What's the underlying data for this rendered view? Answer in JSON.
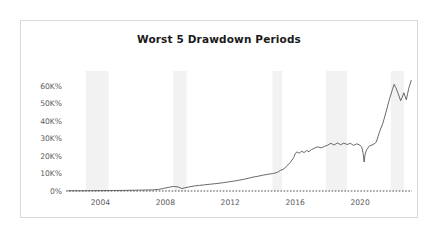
{
  "card": {
    "title": "Worst 5 Drawdown Periods"
  },
  "chart_data": {
    "type": "line",
    "title": "Worst 5 Drawdown Periods",
    "xlabel": "",
    "ylabel": "",
    "grid": false,
    "legend": "none",
    "zero_reference_line": true,
    "xlim": [
      2002.0,
      2023.2
    ],
    "ylim": [
      0,
      65000
    ],
    "yticks": [
      0,
      10000,
      20000,
      30000,
      40000,
      50000,
      60000
    ],
    "ytick_labels": [
      "0%",
      "10K%",
      "20K%",
      "30K%",
      "40K%",
      "50K%",
      "60K%"
    ],
    "xticks": [
      2004,
      2008,
      2012,
      2016,
      2020
    ],
    "xtick_labels": [
      "2004",
      "2008",
      "2012",
      "2016",
      "2020"
    ],
    "series": [
      {
        "name": "Cumulative Return",
        "color": "#4f4f4f",
        "x": [
          2002.0,
          2002.4,
          2002.8,
          2003.2,
          2003.6,
          2004.0,
          2004.4,
          2004.8,
          2005.2,
          2005.6,
          2006.0,
          2006.4,
          2006.8,
          2007.2,
          2007.6,
          2007.9,
          2008.2,
          2008.5,
          2008.8,
          2009.0,
          2009.2,
          2009.5,
          2009.8,
          2010.1,
          2010.4,
          2010.7,
          2011.0,
          2011.3,
          2011.6,
          2011.9,
          2012.2,
          2012.5,
          2012.8,
          2013.1,
          2013.4,
          2013.7,
          2014.0,
          2014.3,
          2014.6,
          2014.9,
          2015.1,
          2015.3,
          2015.5,
          2015.7,
          2015.9,
          2016.0,
          2016.1,
          2016.25,
          2016.4,
          2016.55,
          2016.7,
          2016.85,
          2017.0,
          2017.2,
          2017.4,
          2017.6,
          2017.8,
          2018.0,
          2018.2,
          2018.4,
          2018.6,
          2018.8,
          2019.0,
          2019.2,
          2019.4,
          2019.6,
          2019.8,
          2020.0,
          2020.1,
          2020.18,
          2020.25,
          2020.3,
          2020.4,
          2020.6,
          2020.8,
          2021.0,
          2021.2,
          2021.4,
          2021.6,
          2021.8,
          2022.0,
          2022.1,
          2022.2,
          2022.35,
          2022.5,
          2022.6,
          2022.7,
          2022.85,
          2023.0,
          2023.15
        ],
        "y": [
          120,
          140,
          130,
          160,
          180,
          200,
          240,
          280,
          320,
          380,
          430,
          500,
          560,
          640,
          900,
          1500,
          2100,
          2600,
          2300,
          1400,
          1800,
          2400,
          2900,
          3200,
          3500,
          3800,
          4100,
          4400,
          4800,
          5200,
          5600,
          6100,
          6600,
          7200,
          7900,
          8400,
          9000,
          9500,
          9900,
          10600,
          11800,
          12500,
          14500,
          16200,
          19000,
          21200,
          22300,
          21600,
          22700,
          21900,
          23100,
          22400,
          23600,
          24500,
          25200,
          24600,
          25400,
          26100,
          27200,
          26200,
          27400,
          26400,
          27300,
          26500,
          27200,
          26000,
          26900,
          26100,
          25200,
          22000,
          16500,
          20500,
          23500,
          25900,
          26400,
          27900,
          33800,
          38500,
          45000,
          52000,
          58000,
          60800,
          59000,
          55500,
          51500,
          53500,
          56000,
          52000,
          58500,
          63000
        ]
      }
    ],
    "shaded_drawdown_bands": [
      {
        "index": 1,
        "start": 2003.1,
        "end": 2004.5
      },
      {
        "index": 2,
        "start": 2008.5,
        "end": 2009.3
      },
      {
        "index": 3,
        "start": 2014.6,
        "end": 2015.2
      },
      {
        "index": 4,
        "start": 2017.9,
        "end": 2019.2
      },
      {
        "index": 5,
        "start": 2021.9,
        "end": 2022.7
      }
    ],
    "colors": {
      "line": "#4f4f4f",
      "band": "#f2f2f2",
      "zero_line": "#3a3a3a",
      "axis_text": "#5a5a5a"
    }
  }
}
